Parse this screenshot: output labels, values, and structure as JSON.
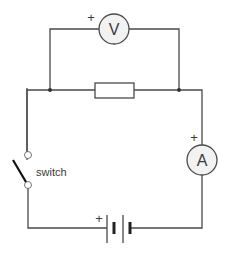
{
  "diagram": {
    "type": "circuit",
    "components": {
      "voltmeter": {
        "symbol": "V",
        "polarity": "+"
      },
      "ammeter": {
        "symbol": "A",
        "polarity": "+"
      },
      "resistor": {
        "label": ""
      },
      "switch": {
        "label": "switch",
        "state": "open"
      },
      "battery": {
        "polarity": "+",
        "cells": 2
      }
    },
    "colors": {
      "wire": "#4a4a4a",
      "meter_fill": "#f2f2f2",
      "background": "#ffffff"
    }
  }
}
